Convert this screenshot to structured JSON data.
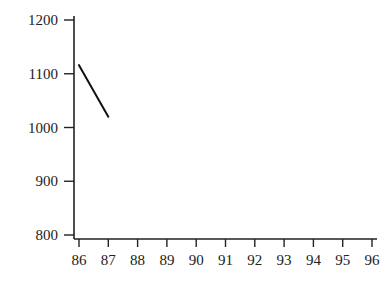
{
  "chart_data": {
    "type": "line",
    "title": "",
    "xlabel": "",
    "ylabel": "",
    "x_ticks": [
      "86",
      "87",
      "88",
      "89",
      "90",
      "91",
      "92",
      "93",
      "94",
      "95",
      "96"
    ],
    "y_ticks": [
      "800",
      "900",
      "1000",
      "1100",
      "1200"
    ],
    "xlim": [
      86,
      96
    ],
    "ylim": [
      800,
      1200
    ],
    "grid": false,
    "legend": null,
    "series": [
      {
        "name": "series-1",
        "x": [
          86,
          87
        ],
        "values": [
          1116,
          1020
        ],
        "color": "#111111"
      }
    ]
  }
}
